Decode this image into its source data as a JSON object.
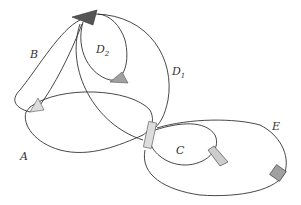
{
  "diagram": {
    "title": "",
    "labels": {
      "A": "A",
      "B": "B",
      "C": "C",
      "D1_main": "D",
      "D1_sub": "1",
      "D2_main": "D",
      "D2_sub": "2",
      "E": "E"
    },
    "colors": {
      "line": "#333333",
      "dark_marker": "#555555",
      "mid_marker": "#a0a0a0",
      "light_marker": "#dddddd"
    },
    "curves": [
      "A",
      "B",
      "C",
      "D1",
      "D2",
      "E"
    ],
    "markers": [
      "top-arrow-dark",
      "d2-arrow",
      "left-arrow",
      "center-rect",
      "c-arrow",
      "e-square"
    ]
  }
}
